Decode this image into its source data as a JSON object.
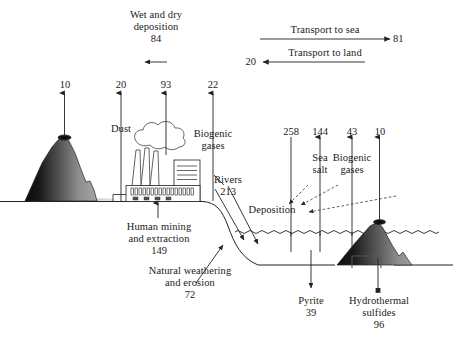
{
  "figure": {
    "type": "diagram",
    "units_note": ""
  },
  "atmosphere_inputs": {
    "wet_dry_deposition": {
      "line1": "Wet and dry",
      "line2": "deposition",
      "value": "84"
    }
  },
  "transport": {
    "to_sea": {
      "label": "Transport to sea",
      "value": "81"
    },
    "to_land": {
      "label": "Transport to land",
      "value": "20"
    }
  },
  "land_fluxes": [
    {
      "name": "volcano-emission",
      "value": "10",
      "label": ""
    },
    {
      "name": "dust-emission",
      "value": "20",
      "label": "Dust"
    },
    {
      "name": "industrial-emission",
      "value": "93",
      "label": ""
    },
    {
      "name": "biogenic-gases-land",
      "value": "22",
      "label_line1": "Biogenic",
      "label_line2": "gases"
    }
  ],
  "ocean_fluxes": [
    {
      "name": "deposition-to-ocean",
      "value": "258",
      "label": ""
    },
    {
      "name": "sea-salt",
      "value": "144",
      "label_line1": "Sea",
      "label_line2": "salt"
    },
    {
      "name": "biogenic-gases-ocean",
      "value": "43",
      "label_line1": "Biogenic",
      "label_line2": "gases"
    },
    {
      "name": "ocean-volcano",
      "value": "10",
      "label": ""
    }
  ],
  "surface_labels": {
    "human_mining": {
      "line1": "Human mining",
      "line2": "and extraction",
      "value": "149"
    },
    "natural_weathering": {
      "line1": "Natural weathering",
      "line2": "and erosion",
      "value": "72"
    },
    "rivers": {
      "line1": "Rivers",
      "value": "213"
    },
    "deposition_ocean": {
      "label": "Deposition"
    },
    "pyrite": {
      "line1": "Pyrite",
      "value": "39"
    },
    "hydrothermal": {
      "line1": "Hydrothermal",
      "line2": "sulfides",
      "value": "96"
    }
  },
  "footer": {
    "partial_caption": ""
  },
  "colors": {
    "stroke": "#222222",
    "background": "#ffffff",
    "volcano_dark": "#111111",
    "volcano_light": "#9a9a9a",
    "faint_text": "#d8d8d8"
  }
}
